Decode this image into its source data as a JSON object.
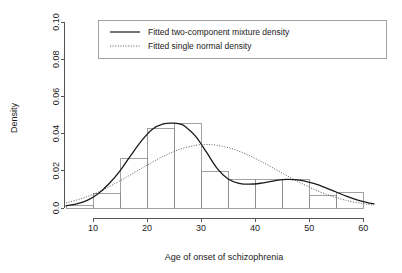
{
  "chart_data": {
    "type": "bar",
    "title": "",
    "subtitle": "",
    "xlabel": "Age of onset of schizophrenia",
    "ylabel": "Density",
    "xlim": [
      5,
      62
    ],
    "ylim": [
      0.0,
      0.1
    ],
    "grid": false,
    "legend_position": "top-center",
    "x_tick_labels": [
      "10",
      "20",
      "30",
      "40",
      "50",
      "60"
    ],
    "x_tick_values": [
      10,
      20,
      30,
      40,
      50,
      60
    ],
    "y_tick_labels": [
      "0.0",
      "0.02",
      "0.04",
      "0.06",
      "0.08",
      "0.10"
    ],
    "y_tick_values": [
      0.0,
      0.02,
      0.04,
      0.06,
      0.08,
      0.1
    ],
    "histogram": {
      "name": "Age of onset histogram",
      "bin_edges": [
        5,
        10,
        15,
        20,
        25,
        30,
        35,
        40,
        45,
        50,
        55,
        60
      ],
      "bin_labels": [
        "5-10",
        "10-15",
        "15-20",
        "20-25",
        "25-30",
        "30-35",
        "35-40",
        "40-45",
        "45-50",
        "50-55",
        "55-60"
      ],
      "densities": [
        0.0015,
        0.008,
        0.0265,
        0.043,
        0.0455,
        0.0195,
        0.0152,
        0.0152,
        0.0152,
        0.0065,
        0.0085
      ]
    },
    "series": [
      {
        "name": "Fitted two-component mixture density",
        "style": "solid",
        "color": "#1a1a1a",
        "x": [
          5,
          7,
          9,
          11,
          13,
          15,
          17,
          19,
          21,
          23,
          25,
          26,
          27,
          29,
          31,
          33,
          35,
          37,
          39,
          41,
          43,
          45,
          46,
          47,
          49,
          51,
          53,
          55,
          57,
          59,
          61,
          62
        ],
        "y": [
          0.0012,
          0.0022,
          0.0042,
          0.0078,
          0.0132,
          0.02,
          0.0283,
          0.0362,
          0.0423,
          0.0452,
          0.0456,
          0.0452,
          0.044,
          0.0385,
          0.03,
          0.0212,
          0.0156,
          0.0133,
          0.0128,
          0.0133,
          0.0143,
          0.0152,
          0.0154,
          0.0153,
          0.0146,
          0.0131,
          0.011,
          0.0086,
          0.0062,
          0.0042,
          0.0028,
          0.0022
        ]
      },
      {
        "name": "Fitted single normal density",
        "style": "dotted",
        "color": "#4a4a4a",
        "x": [
          5,
          8,
          11,
          14,
          17,
          20,
          23,
          26,
          29,
          31,
          33,
          36,
          39,
          42,
          45,
          48,
          51,
          54,
          57,
          60,
          62
        ],
        "y": [
          0.0028,
          0.0052,
          0.0086,
          0.013,
          0.018,
          0.023,
          0.0278,
          0.0315,
          0.0337,
          0.0341,
          0.0337,
          0.0316,
          0.0281,
          0.0236,
          0.0188,
          0.0141,
          0.0099,
          0.0065,
          0.004,
          0.0023,
          0.0015
        ]
      }
    ]
  },
  "legend": {
    "items": [
      {
        "label": "Fitted two-component mixture density",
        "style": "solid"
      },
      {
        "label": "Fitted single normal density",
        "style": "dotted"
      }
    ]
  },
  "axes": {
    "x_title": "Age of onset of schizophrenia",
    "y_title": "Density"
  }
}
